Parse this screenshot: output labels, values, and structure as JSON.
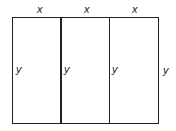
{
  "diagram": {
    "type": "rectangle divided into three equal vertical sections",
    "top_labels": [
      "x",
      "x",
      "x"
    ],
    "side_labels": [
      "y",
      "y",
      "y",
      "y"
    ],
    "line_color": "#222222"
  }
}
